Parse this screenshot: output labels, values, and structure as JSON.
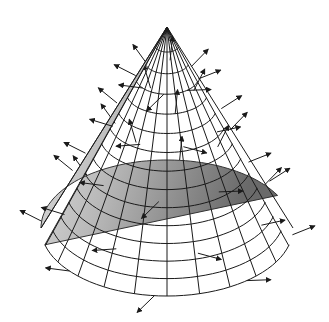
{
  "figure": {
    "apex": [
      167,
      27
    ],
    "base_center": [
      167,
      228
    ],
    "base_rx": 126,
    "base_ry": 68,
    "meridians": 24,
    "rings": 14,
    "colors": {
      "background": "#ffffff",
      "surface_light": "#e4e4e4",
      "surface_dark": "#6f6f6f",
      "grid": "#1a1a1a",
      "arrow": "#1a1a1a"
    },
    "normal_vector_length": 30
  }
}
